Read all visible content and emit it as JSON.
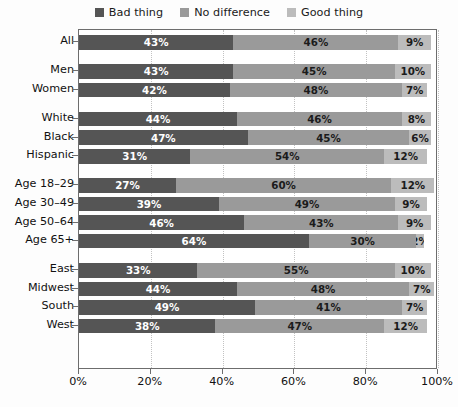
{
  "chart_data": {
    "type": "bar",
    "orientation": "horizontal",
    "stacked": true,
    "title": "",
    "subtitle": "",
    "xlabel": "",
    "ylabel": "",
    "xlim": [
      0,
      100
    ],
    "xticks": [
      0,
      20,
      40,
      60,
      80,
      100
    ],
    "xticklabels": [
      "0%",
      "20%",
      "40%",
      "60%",
      "80%",
      "100%"
    ],
    "grid": true,
    "grid_axis": "x",
    "legend_position": "top-center",
    "categories": [
      "All",
      "Men",
      "Women",
      "White",
      "Black",
      "Hispanic",
      "Age 18–29",
      "Age 30–49",
      "Age 50–64",
      "Age 65+",
      "East",
      "Midwest",
      "South",
      "West"
    ],
    "series": [
      {
        "name": "Bad thing",
        "color": "#555555",
        "values": [
          43,
          43,
          42,
          44,
          47,
          31,
          27,
          39,
          46,
          64,
          33,
          44,
          49,
          38
        ],
        "labels": [
          "43%",
          "43%",
          "42%",
          "44%",
          "47%",
          "31%",
          "27%",
          "39%",
          "46%",
          "64%",
          "33%",
          "44%",
          "49%",
          "38%"
        ]
      },
      {
        "name": "No difference",
        "color": "#9a9a9a",
        "values": [
          46,
          45,
          48,
          46,
          45,
          54,
          60,
          49,
          43,
          30,
          55,
          48,
          41,
          47
        ],
        "labels": [
          "46%",
          "45%",
          "48%",
          "46%",
          "45%",
          "54%",
          "60%",
          "49%",
          "43%",
          "30%",
          "55%",
          "48%",
          "41%",
          "47%"
        ]
      },
      {
        "name": "Good thing",
        "color": "#bcbcbc",
        "values": [
          9,
          10,
          7,
          8,
          6,
          12,
          12,
          9,
          9,
          2,
          10,
          7,
          7,
          12
        ],
        "labels": [
          "9%",
          "10%",
          "7%",
          "8%",
          "6%",
          "12%",
          "12%",
          "9%",
          "9%",
          "2%",
          "10%",
          "7%",
          "7%",
          "12%"
        ]
      }
    ],
    "group_breaks_after": [
      "All",
      "Women",
      "Hispanic",
      "Age 65+"
    ]
  },
  "legend": {
    "items": [
      {
        "label": "Bad thing",
        "color": "#555555"
      },
      {
        "label": "No difference",
        "color": "#9a9a9a"
      },
      {
        "label": "Good thing",
        "color": "#bcbcbc"
      }
    ]
  },
  "colors": {
    "bad": "#555555",
    "neutral": "#9a9a9a",
    "good": "#bcbcbc",
    "axis": "#6d6d6d",
    "grid": "#c2c2c2",
    "background": "#fdfdfd",
    "plot_background": "#ffffff",
    "text": "#111111"
  }
}
